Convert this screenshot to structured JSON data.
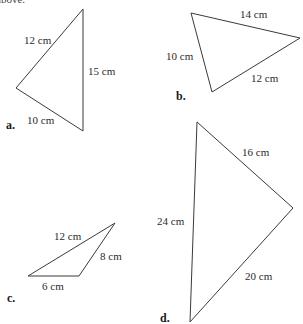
{
  "header": {
    "partial_text": "above."
  },
  "triangles": [
    {
      "label": "a.",
      "label_pos": [
        6,
        129
      ],
      "vertices": [
        [
          83,
          9
        ],
        [
          16,
          88
        ],
        [
          83,
          131
        ]
      ],
      "sides": [
        {
          "text": "12 cm",
          "pos": [
            24,
            44
          ]
        },
        {
          "text": "15 cm",
          "pos": [
            88,
            75
          ]
        },
        {
          "text": "10 cm",
          "pos": [
            27,
            124
          ]
        }
      ]
    },
    {
      "label": "b.",
      "label_pos": [
        176,
        100
      ],
      "vertices": [
        [
          191,
          13
        ],
        [
          300,
          38
        ],
        [
          212,
          92
        ]
      ],
      "sides": [
        {
          "text": "14 cm",
          "pos": [
            240,
            18
          ]
        },
        {
          "text": "10 cm",
          "pos": [
            166,
            60
          ]
        },
        {
          "text": "12 cm",
          "pos": [
            251,
            82
          ]
        }
      ]
    },
    {
      "label": "c.",
      "label_pos": [
        7,
        302
      ],
      "vertices": [
        [
          115,
          223
        ],
        [
          28,
          276
        ],
        [
          79,
          276
        ]
      ],
      "sides": [
        {
          "text": "12 cm",
          "pos": [
            54,
            240
          ]
        },
        {
          "text": "8 cm",
          "pos": [
            100,
            260
          ]
        },
        {
          "text": "6 cm",
          "pos": [
            42,
            290
          ]
        }
      ]
    },
    {
      "label": "d.",
      "label_pos": [
        160,
        322
      ],
      "vertices": [
        [
          197,
          122
        ],
        [
          293,
          208
        ],
        [
          190,
          322
        ]
      ],
      "sides": [
        {
          "text": "24 cm",
          "pos": [
            157,
            225
          ]
        },
        {
          "text": "16 cm",
          "pos": [
            242,
            156
          ]
        },
        {
          "text": "20 cm",
          "pos": [
            245,
            280
          ]
        }
      ]
    }
  ],
  "labels": {
    "a": {
      "name": "a.",
      "sides": [
        "12 cm",
        "15 cm",
        "10 cm"
      ]
    },
    "b": {
      "name": "b.",
      "sides": [
        "14 cm",
        "10 cm",
        "12 cm"
      ]
    },
    "c": {
      "name": "c.",
      "sides": [
        "12 cm",
        "8 cm",
        "6 cm"
      ]
    },
    "d": {
      "name": "d.",
      "sides": [
        "24 cm",
        "16 cm",
        "20 cm"
      ]
    }
  },
  "colors": {
    "stroke": "#3a3a3a",
    "text": "#2a2a2a",
    "background": "#ffffff"
  }
}
